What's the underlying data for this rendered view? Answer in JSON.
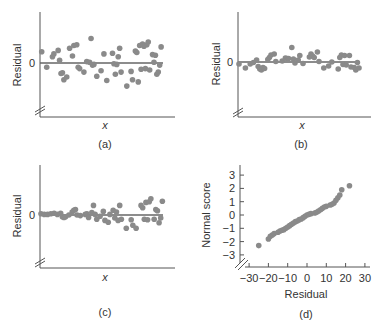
{
  "chart_data": [
    {
      "type": "scatter",
      "panel": "(a)",
      "xlabel": "x",
      "ylabel": "Residual",
      "ytick_labels": [
        "0"
      ],
      "caption": "(a)",
      "reference_line": "y = 0",
      "description": "Residuals randomly scattered around zero with constant spread",
      "points": [
        [
          0.5,
          1.6
        ],
        [
          4,
          -0.6
        ],
        [
          8,
          0.9
        ],
        [
          9,
          1.3
        ],
        [
          12,
          1.8
        ],
        [
          13,
          0.4
        ],
        [
          14,
          -1.5
        ],
        [
          15,
          -1.4
        ],
        [
          16,
          -2.4
        ],
        [
          18,
          -2.0
        ],
        [
          20,
          2.1
        ],
        [
          22,
          1.0
        ],
        [
          23,
          2.5
        ],
        [
          25,
          2.6
        ],
        [
          26,
          -0.6
        ],
        [
          27,
          -0.8
        ],
        [
          30,
          -1.3
        ],
        [
          32,
          0.2
        ],
        [
          34,
          0.1
        ],
        [
          35,
          3.5
        ],
        [
          36,
          -0.3
        ],
        [
          37,
          -0.2
        ],
        [
          39,
          -1.9
        ],
        [
          42,
          -1.1
        ],
        [
          44,
          1.3
        ],
        [
          46,
          -2.5
        ],
        [
          50,
          1.4
        ],
        [
          51,
          -0.1
        ],
        [
          52,
          -1.6
        ],
        [
          53,
          -0.2
        ],
        [
          54,
          0.9
        ],
        [
          55,
          2.1
        ],
        [
          56,
          -1.3
        ],
        [
          60,
          -3.3
        ],
        [
          63,
          -1.2
        ],
        [
          64,
          -2.4
        ],
        [
          66,
          1.7
        ],
        [
          67,
          1.5
        ],
        [
          68,
          -2.7
        ],
        [
          69,
          2.5
        ],
        [
          70,
          -0.9
        ],
        [
          71,
          2.7
        ],
        [
          72,
          2.4
        ],
        [
          73,
          -0.8
        ],
        [
          74,
          2.6
        ],
        [
          75,
          3.0
        ],
        [
          76,
          -1.0
        ],
        [
          78,
          1.2
        ],
        [
          79,
          0.1
        ],
        [
          80,
          1.1
        ],
        [
          81,
          -1.6
        ],
        [
          82,
          -1.3
        ],
        [
          83,
          -0.3
        ],
        [
          84,
          2.3
        ]
      ]
    },
    {
      "type": "scatter",
      "panel": "(b)",
      "xlabel": "x",
      "ylabel": "Residual",
      "ytick_labels": [
        "0"
      ],
      "caption": "(b)",
      "reference_line": "y = 0",
      "description": "Residuals show curved pattern (positive in middle, negative at ends)",
      "points": [
        [
          0,
          -0.4
        ],
        [
          4,
          -1.2
        ],
        [
          7,
          -0.4
        ],
        [
          9,
          -0.1
        ],
        [
          11,
          0.4
        ],
        [
          12,
          -0.9
        ],
        [
          13,
          -1.4
        ],
        [
          14,
          -1.6
        ],
        [
          15,
          -1.1
        ],
        [
          16,
          -1.3
        ],
        [
          18,
          0.5
        ],
        [
          19,
          0.9
        ],
        [
          20,
          1.4
        ],
        [
          22,
          1.6
        ],
        [
          23,
          0.1
        ],
        [
          27,
          0.2
        ],
        [
          29,
          0.8
        ],
        [
          30,
          0.7
        ],
        [
          31,
          0.7
        ],
        [
          33,
          2.9
        ],
        [
          34,
          0.6
        ],
        [
          35,
          -0.2
        ],
        [
          37,
          0.4
        ],
        [
          38,
          1.3
        ],
        [
          40,
          -0.3
        ],
        [
          44,
          1.0
        ],
        [
          45,
          1.6
        ],
        [
          46,
          1.2
        ],
        [
          47,
          0.9
        ],
        [
          49,
          2.0
        ],
        [
          50,
          0.1
        ],
        [
          53,
          -1.2
        ],
        [
          56,
          -0.8
        ],
        [
          58,
          0.0
        ],
        [
          62,
          -1.4
        ],
        [
          63,
          0.9
        ],
        [
          64,
          1.4
        ],
        [
          65,
          -0.5
        ],
        [
          66,
          1.3
        ],
        [
          67,
          -0.6
        ],
        [
          69,
          1.3
        ],
        [
          70,
          -1.0
        ],
        [
          72,
          -1.1
        ],
        [
          73,
          -1.6
        ],
        [
          74,
          -0.1
        ],
        [
          75,
          -1.2
        ]
      ]
    },
    {
      "type": "scatter",
      "panel": "(c)",
      "xlabel": "x",
      "ylabel": "Residual",
      "ytick_labels": [
        "0"
      ],
      "caption": "(c)",
      "reference_line": "y = 0",
      "description": "Residual spread increases with x (fan-shaped, heteroscedastic)",
      "points": [
        [
          0,
          0.2
        ],
        [
          2,
          0.1
        ],
        [
          4,
          0.1
        ],
        [
          6,
          0.2
        ],
        [
          8,
          0.3
        ],
        [
          10,
          0.1
        ],
        [
          12,
          0.3
        ],
        [
          13,
          -0.3
        ],
        [
          14,
          -0.4
        ],
        [
          15,
          -0.3
        ],
        [
          17,
          0.0
        ],
        [
          19,
          0.5
        ],
        [
          20,
          0.8
        ],
        [
          21,
          0.9
        ],
        [
          22,
          0.0
        ],
        [
          24,
          -0.1
        ],
        [
          27,
          0.1
        ],
        [
          28,
          0.2
        ],
        [
          29,
          -0.4
        ],
        [
          31,
          0.4
        ],
        [
          32,
          1.6
        ],
        [
          33,
          0.1
        ],
        [
          34,
          -0.7
        ],
        [
          36,
          -0.2
        ],
        [
          38,
          0.6
        ],
        [
          39,
          -0.9
        ],
        [
          41,
          -1.2
        ],
        [
          42,
          0.1
        ],
        [
          44,
          0.8
        ],
        [
          45,
          -0.5
        ],
        [
          46,
          0.5
        ],
        [
          47,
          -0.9
        ],
        [
          48,
          1.6
        ],
        [
          49,
          -0.7
        ],
        [
          52,
          -2.2
        ],
        [
          55,
          -0.8
        ],
        [
          56,
          -1.7
        ],
        [
          58,
          -2.2
        ],
        [
          61,
          1.6
        ],
        [
          62,
          1.2
        ],
        [
          63,
          -0.7
        ],
        [
          64,
          2.1
        ],
        [
          65,
          -0.8
        ],
        [
          66,
          2.2
        ],
        [
          67,
          2.7
        ],
        [
          69,
          -0.7
        ],
        [
          70,
          0.9
        ],
        [
          71,
          0.7
        ],
        [
          72,
          -1.3
        ],
        [
          73,
          -0.5
        ],
        [
          74,
          2.3
        ]
      ]
    },
    {
      "type": "scatter",
      "panel": "(d)",
      "title": "",
      "xlabel": "Residual",
      "ylabel": "Normal score",
      "caption": "(d)",
      "xlim": [
        -30,
        30
      ],
      "ylim": [
        -3,
        3
      ],
      "xtick_labels": [
        "-30",
        "-20",
        "-10",
        "0",
        "10",
        "20",
        "30"
      ],
      "ytick_labels": [
        "3",
        "2",
        "1",
        "0",
        "-1",
        "-2",
        "-3"
      ],
      "description": "Normal probability plot of residuals, approximately linear",
      "points": [
        [
          -25,
          -2.3
        ],
        [
          -20,
          -1.8
        ],
        [
          -19,
          -1.6
        ],
        [
          -18,
          -1.5
        ],
        [
          -17,
          -1.4
        ],
        [
          -15,
          -1.3
        ],
        [
          -14,
          -1.2
        ],
        [
          -13,
          -1.15
        ],
        [
          -12,
          -1.1
        ],
        [
          -11,
          -1.0
        ],
        [
          -10,
          -0.9
        ],
        [
          -9,
          -0.8
        ],
        [
          -8,
          -0.7
        ],
        [
          -7,
          -0.6
        ],
        [
          -6,
          -0.5
        ],
        [
          -5,
          -0.45
        ],
        [
          -4,
          -0.35
        ],
        [
          -3,
          -0.3
        ],
        [
          -2,
          -0.2
        ],
        [
          -1,
          -0.1
        ],
        [
          0,
          0.0
        ],
        [
          1,
          0.05
        ],
        [
          2,
          0.1
        ],
        [
          4,
          0.15
        ],
        [
          5,
          0.2
        ],
        [
          6,
          0.3
        ],
        [
          7,
          0.4
        ],
        [
          8,
          0.5
        ],
        [
          9,
          0.6
        ],
        [
          10,
          0.65
        ],
        [
          12,
          0.75
        ],
        [
          13,
          0.8
        ],
        [
          14,
          0.9
        ],
        [
          15,
          1.1
        ],
        [
          16,
          1.3
        ],
        [
          17,
          1.5
        ],
        [
          18,
          1.9
        ],
        [
          22,
          2.2
        ]
      ]
    }
  ],
  "panels": {
    "a": {
      "ylabel": "Residual",
      "zero": "0",
      "xlabel": "x",
      "caption": "(a)"
    },
    "b": {
      "ylabel": "Residual",
      "zero": "0",
      "xlabel": "x",
      "caption": "(b)"
    },
    "c": {
      "ylabel": "Residual",
      "zero": "0",
      "xlabel": "x",
      "caption": "(c)"
    },
    "d": {
      "ylabel": "Normal score",
      "xlabel": "Residual",
      "caption": "(d)",
      "xticks": [
        "−30",
        "−20",
        "−10",
        "0",
        "10",
        "20",
        "30"
      ],
      "yticks": [
        "3",
        "2",
        "1",
        "0",
        "−1",
        "−2",
        "−3"
      ]
    }
  },
  "colors": {
    "axis": "#555555",
    "point": "#8a8a8a",
    "zero_line": "#666666",
    "text": "#333333"
  }
}
